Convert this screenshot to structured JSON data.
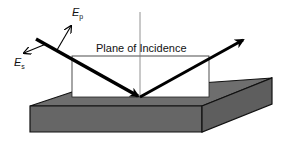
{
  "diagram": {
    "labels": {
      "plane": "Plane of Incidence",
      "ep_main": "E",
      "ep_sub": "p",
      "es_main": "E",
      "es_sub": "s"
    },
    "colors": {
      "ray": "#000000",
      "sample_top": "#6e6e6e",
      "sample_front": "#666666",
      "sample_side": "#5e5e5e",
      "plane_fill": "#ffffff",
      "outline": "#111111"
    },
    "elements": [
      "incident-ray",
      "reflected-ray",
      "plane-of-incidence",
      "surface-normal",
      "sample-block",
      "ep-vector",
      "es-vector"
    ]
  }
}
